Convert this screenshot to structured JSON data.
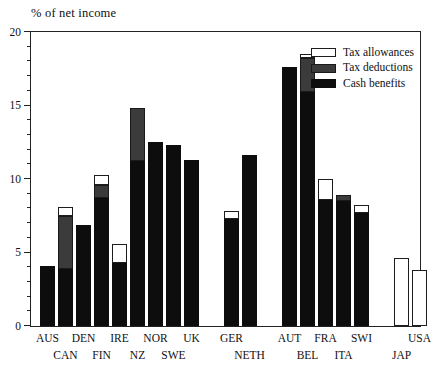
{
  "chart_data": {
    "type": "bar",
    "subtype": "stacked",
    "title": "% of net income",
    "xlabel": "",
    "ylabel": "% of net income",
    "ylim": [
      0,
      20
    ],
    "yticks": [
      0,
      5,
      10,
      15,
      20
    ],
    "ytick_labels": [
      "0",
      "5",
      "10",
      "15",
      "20"
    ],
    "minor_tick_step": 1,
    "grid": false,
    "legend_position": "top-right",
    "categories": [
      "AUS",
      "CAN",
      "DEN",
      "FIN",
      "IRE",
      "NZ",
      "NOR",
      "SWE",
      "UK",
      "GER",
      "NETH",
      "AUT",
      "BEL",
      "FRA",
      "ITA",
      "SWI",
      "JAP",
      "USA"
    ],
    "groups": [
      {
        "name": "group-1",
        "categories": [
          "AUS",
          "CAN",
          "DEN",
          "FIN",
          "IRE",
          "NZ",
          "NOR",
          "SWE",
          "UK"
        ]
      },
      {
        "name": "group-2",
        "categories": [
          "GER",
          "NETH"
        ]
      },
      {
        "name": "group-3",
        "categories": [
          "AUT",
          "BEL",
          "FRA",
          "ITA",
          "SWI"
        ]
      },
      {
        "name": "group-4",
        "categories": [
          "JAP",
          "USA"
        ]
      }
    ],
    "series": [
      {
        "name": "Cash benefits",
        "color": "#0d0d0d",
        "values": [
          4.1,
          3.9,
          6.9,
          8.7,
          4.3,
          11.2,
          12.5,
          12.3,
          11.3,
          7.3,
          11.6,
          17.6,
          15.9,
          8.6,
          8.5,
          7.7,
          0.0,
          0.0
        ]
      },
      {
        "name": "Tax deductions",
        "color": "#3b3b3b",
        "values": [
          0.0,
          3.6,
          0.0,
          0.9,
          0.0,
          3.6,
          0.0,
          0.0,
          0.0,
          0.0,
          0.0,
          0.0,
          2.3,
          0.0,
          0.4,
          0.0,
          0.0,
          0.0
        ]
      },
      {
        "name": "Tax allowances",
        "color": "#ffffff",
        "values": [
          0.0,
          0.6,
          0.0,
          0.7,
          1.3,
          0.0,
          0.0,
          0.0,
          0.0,
          0.5,
          0.0,
          0.0,
          0.3,
          1.4,
          0.0,
          0.5,
          4.6,
          3.8
        ]
      }
    ],
    "totals": [
      4.1,
      8.1,
      6.9,
      10.3,
      5.6,
      14.8,
      12.5,
      12.3,
      11.3,
      7.8,
      11.6,
      17.6,
      18.5,
      10.0,
      8.9,
      8.2,
      4.6,
      3.8
    ]
  },
  "legend": {
    "items": [
      {
        "label": "Tax allowances",
        "swatch": "allow"
      },
      {
        "label": "Tax deductions",
        "swatch": "deduct"
      },
      {
        "label": "Cash benefits",
        "swatch": "cash"
      }
    ]
  },
  "axis": {
    "title": "% of net income"
  },
  "xaxis": {
    "labels": [
      {
        "text": "AUS",
        "row": 0
      },
      {
        "text": "CAN",
        "row": 1
      },
      {
        "text": "DEN",
        "row": 0
      },
      {
        "text": "FIN",
        "row": 1
      },
      {
        "text": "IRE",
        "row": 0
      },
      {
        "text": "NZ",
        "row": 1
      },
      {
        "text": "NOR",
        "row": 0
      },
      {
        "text": "SWE",
        "row": 1
      },
      {
        "text": "UK",
        "row": 0
      },
      {
        "text": "GER",
        "row": 0
      },
      {
        "text": "NETH",
        "row": 1
      },
      {
        "text": "AUT",
        "row": 0
      },
      {
        "text": "BEL",
        "row": 1
      },
      {
        "text": "FRA",
        "row": 0
      },
      {
        "text": "ITA",
        "row": 1
      },
      {
        "text": "SWI",
        "row": 0
      },
      {
        "text": "JAP",
        "row": 1
      },
      {
        "text": "USA",
        "row": 0
      }
    ]
  }
}
